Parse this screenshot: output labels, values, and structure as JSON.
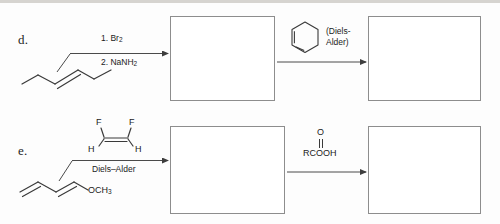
{
  "page": {
    "background": "#fdfdfd",
    "ink": "#1b1b1b",
    "line_color": "#555555",
    "box_border": "#8d8d8d"
  },
  "problems": [
    {
      "id": "d",
      "label": "d.",
      "starting_material": {
        "name": "trans-3-hexene",
        "formula_text": ""
      },
      "steps": [
        {
          "arrow": "reaction-arrow",
          "above_label": "1. Br",
          "above_sub": "2",
          "below_label": "2. NaNH",
          "below_sub": "2",
          "product_box": "answer-box-d1"
        },
        {
          "arrow": "reaction-arrow",
          "reagent_structure": "cyclohexa-1,3-diene",
          "reagent_label_line1": "(Diels-",
          "reagent_label_line2": "Alder)",
          "product_box": "answer-box-d2"
        }
      ]
    },
    {
      "id": "e",
      "label": "e.",
      "starting_material": {
        "name": "1-methoxy-1,3-butadiene",
        "substituent": "OCH",
        "substituent_sub": "3"
      },
      "steps": [
        {
          "arrow": "reaction-arrow",
          "reagent_structure": "cis-1,2-difluoroethene",
          "reagent_atoms": [
            "F",
            "F",
            "H",
            "H"
          ],
          "below_label": "Diels–Alder",
          "product_box": "answer-box-e1"
        },
        {
          "arrow": "reaction-arrow",
          "reagent_oxygen": "O",
          "reagent_label": "RCOOH",
          "product_box": "answer-box-e2"
        }
      ]
    }
  ],
  "boxes": {
    "d1": {
      "x": 170,
      "y": 16,
      "w": 105,
      "h": 85
    },
    "d2": {
      "x": 368,
      "y": 16,
      "w": 113,
      "h": 85
    },
    "e1": {
      "x": 170,
      "y": 126,
      "w": 115,
      "h": 88
    },
    "e2": {
      "x": 368,
      "y": 126,
      "w": 113,
      "h": 88
    }
  }
}
